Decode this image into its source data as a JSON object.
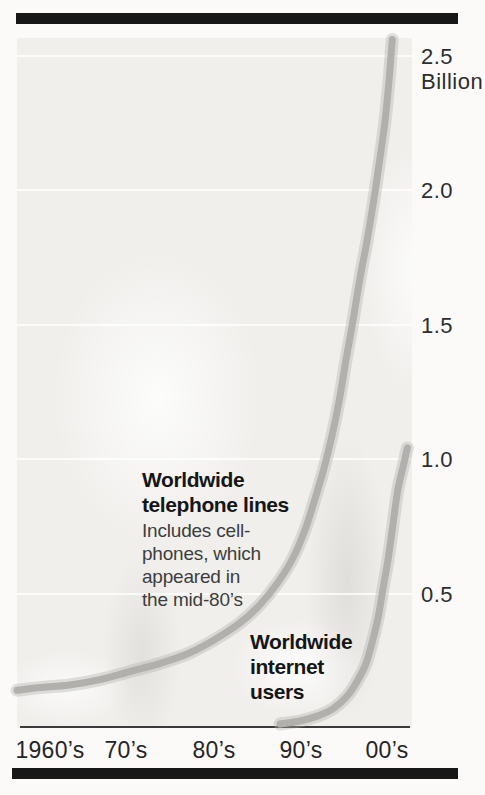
{
  "chart_data": {
    "type": "line",
    "title": "",
    "unit": "Billion",
    "ylim": [
      0,
      2.6
    ],
    "x_axis_years": [
      1960,
      2010
    ],
    "grid": "faint white horizontal lines every 0.5 billion",
    "legend_position": "inline annotations on plot",
    "yticks": [
      {
        "label": "2.5",
        "sub": "Billion",
        "value": 2.5
      },
      {
        "label": "2.0",
        "sub": "",
        "value": 2.0
      },
      {
        "label": "1.5",
        "sub": "",
        "value": 1.5
      },
      {
        "label": "1.0",
        "sub": "",
        "value": 1.0
      },
      {
        "label": "0.5",
        "sub": "",
        "value": 0.5
      }
    ],
    "xticks": [
      "1960’s",
      "70’s",
      "80’s",
      "90’s",
      "00’s"
    ],
    "series": [
      {
        "name": "Worldwide telephone lines",
        "annotation": "Worldwide\ntelephone lines",
        "caption": "Includes cell-\nphones, which\nappeared in\nthe mid-80’s",
        "points": [
          [
            1960.0,
            0.14
          ],
          [
            1962.9,
            0.15
          ],
          [
            1966.7,
            0.16
          ],
          [
            1970.5,
            0.18
          ],
          [
            1974.3,
            0.21
          ],
          [
            1978.1,
            0.24
          ],
          [
            1981.9,
            0.28
          ],
          [
            1985.1,
            0.33
          ],
          [
            1988.2,
            0.39
          ],
          [
            1990.8,
            0.46
          ],
          [
            1993.0,
            0.54
          ],
          [
            1994.9,
            0.63
          ],
          [
            1996.5,
            0.74
          ],
          [
            1997.7,
            0.85
          ],
          [
            1998.9,
            0.97
          ],
          [
            1999.9,
            1.09
          ],
          [
            2000.8,
            1.22
          ],
          [
            2001.6,
            1.36
          ],
          [
            2002.5,
            1.51
          ],
          [
            2003.4,
            1.67
          ],
          [
            2004.3,
            1.81
          ],
          [
            2005.2,
            1.97
          ],
          [
            2005.9,
            2.11
          ],
          [
            2006.6,
            2.26
          ],
          [
            2007.1,
            2.41
          ],
          [
            2007.5,
            2.56
          ]
        ]
      },
      {
        "name": "Worldwide internet users",
        "annotation": "Worldwide\ninternet\nusers",
        "caption": "",
        "points": [
          [
            1993.3,
            0.015
          ],
          [
            1995.8,
            0.026
          ],
          [
            1998.1,
            0.045
          ],
          [
            2000.1,
            0.074
          ],
          [
            2001.8,
            0.119
          ],
          [
            2003.0,
            0.171
          ],
          [
            2004.1,
            0.234
          ],
          [
            2004.9,
            0.312
          ],
          [
            2005.7,
            0.409
          ],
          [
            2006.3,
            0.513
          ],
          [
            2007.0,
            0.632
          ],
          [
            2007.6,
            0.758
          ],
          [
            2008.2,
            0.885
          ],
          [
            2008.9,
            0.974
          ],
          [
            2009.4,
            1.041
          ]
        ]
      }
    ],
    "pixel_scale": {
      "x0": 17,
      "px_per_year": 7.9,
      "y0": 728,
      "px_per_billion": 269
    }
  },
  "colors": {
    "curve": "#b1b0ad",
    "curve_halo": "rgba(177,176,173,0.38)",
    "rule": "#171717",
    "plot_bg": "#f0efec",
    "axis_line": "#3b3b3b",
    "label_text": "#161616",
    "caption_text": "#3d3d3d"
  }
}
